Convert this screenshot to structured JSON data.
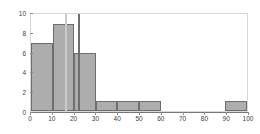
{
  "chart_data": {
    "type": "bar",
    "title": "",
    "subtitle": "",
    "xlabel": "",
    "ylabel": "",
    "xlim": [
      0,
      100
    ],
    "ylim": [
      0,
      10
    ],
    "grid": false,
    "legend": null,
    "bin_width": 10,
    "bin_edges": [
      0,
      10,
      20,
      30,
      40,
      50,
      60,
      70,
      80,
      90,
      100
    ],
    "categories": [
      "0-10",
      "10-20",
      "20-30",
      "30-40",
      "40-50",
      "50-60",
      "60-70",
      "70-80",
      "80-90",
      "90-100"
    ],
    "values": [
      7,
      9,
      6,
      1,
      1,
      1,
      0,
      0,
      0,
      1
    ],
    "x_ticks": [
      0,
      10,
      20,
      30,
      40,
      50,
      60,
      70,
      80,
      90,
      100
    ],
    "x_tick_labels": [
      "0",
      "10",
      "20",
      "30",
      "40",
      "50",
      "60",
      "70",
      "80",
      "90",
      "100"
    ],
    "y_ticks": [
      0,
      2,
      4,
      6,
      8,
      10
    ],
    "y_tick_labels": [
      "0",
      "2",
      "4",
      "6",
      "8",
      "10"
    ],
    "annotations": [
      {
        "name": "reference-line-light",
        "x": 16,
        "color": "#c9c9c9"
      },
      {
        "name": "reference-line-dark",
        "x": 22,
        "color": "#6e6e6e"
      }
    ],
    "colors": {
      "bar_fill": "#adadad",
      "bar_edge": "#6e6e6e",
      "axis": "#777777",
      "frame": "#d8d8d8",
      "tick_text": "#3c3c3c",
      "background": "#ffffff"
    }
  }
}
